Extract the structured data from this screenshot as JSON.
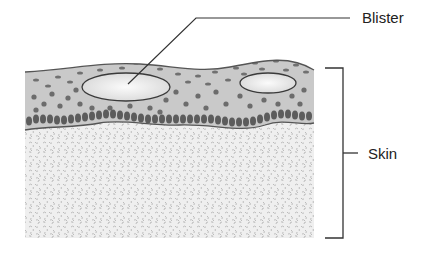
{
  "diagram": {
    "type": "anatomical-cross-section",
    "labels": {
      "blister": "Blister",
      "skin": "Skin"
    },
    "colors": {
      "background": "#ffffff",
      "epidermis_fill": "#c8c8c8",
      "epidermis_outline": "#555555",
      "cell_dots": "#707070",
      "basal_cells": "#5e5e5e",
      "blister_fill": "#f2f2f2",
      "blister_outline": "#3a3a3a",
      "dermis_base": "#eeeeee",
      "dermis_texture": "#b9b9b9",
      "line": "#333333",
      "text": "#222222"
    },
    "blisters": [
      {
        "cx": 126,
        "cy": 87,
        "rx": 44,
        "ry": 14
      },
      {
        "cx": 268,
        "cy": 83,
        "rx": 28,
        "ry": 10
      }
    ],
    "bracket": {
      "x_left": 325,
      "x_right": 343,
      "y_top": 68,
      "y_bottom": 238,
      "tick_to": 358,
      "tick_y": 153
    },
    "leader": {
      "start": [
        128,
        84
      ],
      "bend": [
        196,
        18
      ],
      "end": [
        350,
        18
      ]
    }
  }
}
